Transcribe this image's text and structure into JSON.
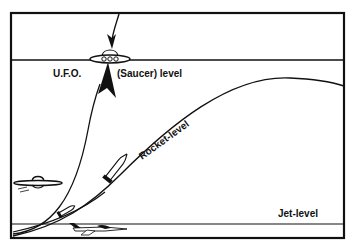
{
  "diagram": {
    "levels": {
      "saucer": {
        "label_prefix": "U.F.O.",
        "label_suffix": "(Saucer) level"
      },
      "rocket": {
        "label": "Rocket-level"
      },
      "jet": {
        "label": "Jet-level"
      }
    },
    "icons": {
      "ufo_main": "flying-saucer",
      "ufo_small": "flying-saucer",
      "rocket": "rocket",
      "jet": "jet-plane",
      "arrow": "arrow-down",
      "arrowhead_up": "arrow-up"
    },
    "colors": {
      "ink": "#111111",
      "background": "#ffffff"
    }
  }
}
